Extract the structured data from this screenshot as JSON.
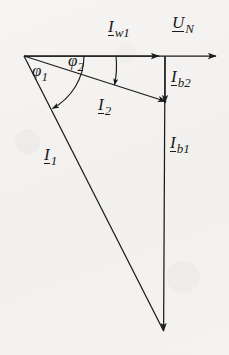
{
  "figure": {
    "kind": "phasor-diagram",
    "background_color": "#f3f2f0",
    "ink_color": "#1b1b1b",
    "width": 229,
    "height": 355,
    "origin": {
      "x": 24,
      "y": 56
    }
  },
  "labels": {
    "i_w1": {
      "symbol": "I",
      "subscript": "w1",
      "x": 108,
      "y": 18
    },
    "u_n": {
      "symbol": "U",
      "subscript": "N",
      "x": 172,
      "y": 14
    },
    "i_b2": {
      "symbol": "I",
      "subscript": "b2",
      "x": 171,
      "y": 68
    },
    "i_2": {
      "symbol": "I",
      "subscript": "2",
      "x": 98,
      "y": 96
    },
    "i_b1": {
      "symbol": "I",
      "subscript": "b1",
      "x": 170,
      "y": 134
    },
    "i_1": {
      "symbol": "I",
      "subscript": "1",
      "x": 44,
      "y": 146
    }
  },
  "angles": {
    "phi1": {
      "symbol": "φ",
      "subscript": "1",
      "x": 32,
      "y": 64
    },
    "phi2": {
      "symbol": "φ",
      "subscript": "2",
      "x": 68,
      "y": 52
    }
  },
  "vectors": {
    "u_n": {
      "from": {
        "x": 24,
        "y": 56
      },
      "to": {
        "x": 215,
        "y": 56
      },
      "label": "U_N"
    },
    "i_w1": {
      "from": {
        "x": 24,
        "y": 56
      },
      "to": {
        "x": 158,
        "y": 56
      },
      "label": "I_w1"
    },
    "i_2": {
      "from": {
        "x": 24,
        "y": 56
      },
      "to": {
        "x": 165,
        "y": 101
      },
      "label": "I_2"
    },
    "i_b2": {
      "from": {
        "x": 165,
        "y": 56
      },
      "to": {
        "x": 165,
        "y": 101
      },
      "label": "I_b2"
    },
    "i_1": {
      "from": {
        "x": 24,
        "y": 56
      },
      "to": {
        "x": 163,
        "y": 330
      },
      "label": "I_1"
    },
    "i_b1": {
      "from": {
        "x": 165,
        "y": 56
      },
      "to": {
        "x": 163,
        "y": 330
      },
      "label": "I_b1"
    }
  }
}
